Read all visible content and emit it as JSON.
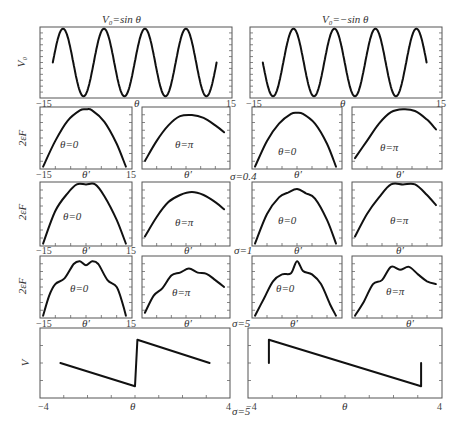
{
  "figure": {
    "row_titles": {
      "left": "V₀=sin θ",
      "right": "V₀=−sin θ"
    },
    "y_labels": {
      "row1": "V₀",
      "row2": "2εF",
      "row3": "2εF",
      "row4": "2εF",
      "row5": "V"
    },
    "x_labels": {
      "theta": "θ",
      "theta_prime": "θ′"
    },
    "ticks": {
      "neg15": "−15",
      "pos15": "15",
      "neg4": "−4",
      "pos4": "4"
    },
    "sigma_labels": {
      "s04": "σ=0.4",
      "s1": "σ=1",
      "s5a": "σ=5",
      "s5b": "σ=5"
    },
    "panel_labels": {
      "theta0": "θ=0",
      "thetapi": "θ=π"
    }
  },
  "chart_data": [
    {
      "type": "line",
      "title": "V₀=sin θ",
      "xlabel": "θ",
      "ylabel": "V₀",
      "xlim": [
        -15,
        15
      ],
      "x": [
        -13,
        -11.4,
        -9.8,
        -8.2,
        -6.6,
        -5,
        -3.4,
        -1.8,
        -0.2,
        1.4,
        3,
        4.6,
        6.2,
        7.8,
        9.4,
        11,
        12.6
      ],
      "values": [
        0,
        1,
        0,
        -1,
        0,
        1,
        0,
        -1,
        0,
        1,
        0,
        -1,
        0,
        1,
        0,
        -1,
        0
      ]
    },
    {
      "type": "line",
      "title": "V₀=−sin θ",
      "xlabel": "θ",
      "ylabel": "V₀",
      "xlim": [
        -15,
        15
      ],
      "x": [
        -13,
        -11.4,
        -9.8,
        -8.2,
        -6.6,
        -5,
        -3.4,
        -1.8,
        -0.2,
        1.4,
        3,
        4.6,
        6.2,
        7.8,
        9.4,
        11,
        12.6
      ],
      "values": [
        0,
        -1,
        0,
        1,
        0,
        -1,
        0,
        1,
        0,
        -1,
        0,
        1,
        0,
        -1,
        0,
        1,
        0
      ]
    },
    {
      "type": "line",
      "title": "σ=0.4, V₀=sin θ, θ=0",
      "xlabel": "θ′",
      "ylabel": "2εF",
      "xlim": [
        -15,
        15
      ],
      "x": [
        -14,
        -10,
        -6,
        -2,
        0,
        2,
        6,
        10,
        13
      ],
      "values": [
        0.0,
        0.45,
        0.8,
        0.98,
        1.0,
        0.98,
        0.78,
        0.4,
        0.0
      ]
    },
    {
      "type": "line",
      "title": "σ=0.4, V₀=sin θ, θ=π",
      "xlabel": "θ′",
      "ylabel": "2εF",
      "x": [
        -14,
        -10,
        -6,
        -2,
        2,
        6,
        10,
        13
      ],
      "values": [
        0.1,
        0.45,
        0.72,
        0.88,
        0.9,
        0.85,
        0.72,
        0.6
      ]
    },
    {
      "type": "line",
      "title": "σ=0.4, V₀=−sin θ, θ=0",
      "xlabel": "θ′",
      "ylabel": "2εF",
      "x": [
        -14,
        -10,
        -6,
        -2,
        0,
        2,
        6,
        10,
        13
      ],
      "values": [
        0.0,
        0.45,
        0.75,
        0.92,
        0.94,
        0.92,
        0.75,
        0.4,
        0.0
      ]
    },
    {
      "type": "line",
      "title": "σ=0.4, V₀=−sin θ, θ=π",
      "xlabel": "θ′",
      "ylabel": "2εF",
      "x": [
        -14,
        -10,
        -6,
        -2,
        2,
        6,
        10,
        13
      ],
      "values": [
        0.15,
        0.45,
        0.75,
        0.95,
        1.0,
        0.97,
        0.82,
        0.65
      ]
    },
    {
      "type": "line",
      "title": "σ=1, V₀=sin θ, θ=0",
      "xlabel": "θ′",
      "ylabel": "2εF",
      "xlim": [
        -15,
        15
      ],
      "x": [
        -14,
        -10,
        -6,
        -3,
        0,
        3,
        6,
        10,
        13
      ],
      "values": [
        0.0,
        0.55,
        0.85,
        1.0,
        1.0,
        1.0,
        0.8,
        0.4,
        0.0
      ]
    },
    {
      "type": "line",
      "title": "σ=1, V₀=sin θ, θ=π",
      "xlabel": "θ′",
      "ylabel": "2εF",
      "x": [
        -14,
        -10,
        -6,
        -2,
        2,
        6,
        10,
        13
      ],
      "values": [
        0.12,
        0.45,
        0.7,
        0.82,
        0.87,
        0.82,
        0.7,
        0.58
      ]
    },
    {
      "type": "line",
      "title": "σ=1, V₀=−sin θ, θ=0",
      "xlabel": "θ′",
      "ylabel": "2εF",
      "x": [
        -14,
        -10,
        -6,
        -3,
        0,
        3,
        6,
        10,
        13
      ],
      "values": [
        0.0,
        0.5,
        0.78,
        0.86,
        0.92,
        0.85,
        0.76,
        0.4,
        0.0
      ]
    },
    {
      "type": "line",
      "title": "σ=1, V₀=−sin θ, θ=π",
      "xlabel": "θ′",
      "ylabel": "2εF",
      "x": [
        -14,
        -10,
        -6,
        -2,
        2,
        6,
        10,
        13
      ],
      "values": [
        0.12,
        0.5,
        0.78,
        1.0,
        1.0,
        1.0,
        0.82,
        0.65
      ]
    },
    {
      "type": "line",
      "title": "σ=5, V₀=sin θ, θ=0",
      "xlabel": "θ′",
      "ylabel": "2εF",
      "xlim": [
        -15,
        15
      ],
      "x": [
        -14,
        -12,
        -10,
        -7,
        -4,
        -2,
        0,
        2,
        4,
        7,
        10,
        12,
        13
      ],
      "values": [
        0.0,
        0.35,
        0.55,
        0.65,
        0.9,
        0.95,
        0.88,
        0.95,
        0.9,
        0.62,
        0.5,
        0.2,
        0.0
      ]
    },
    {
      "type": "line",
      "title": "σ=5, V₀=sin θ, θ=π",
      "xlabel": "θ′",
      "ylabel": "2εF",
      "x": [
        -14,
        -11,
        -8,
        -5,
        -2,
        1,
        4,
        7,
        10,
        13
      ],
      "values": [
        0.05,
        0.35,
        0.48,
        0.7,
        0.75,
        0.82,
        0.75,
        0.73,
        0.62,
        0.5
      ]
    },
    {
      "type": "line",
      "title": "σ=5, V₀=−sin θ, θ=0",
      "xlabel": "θ′",
      "ylabel": "2εF",
      "x": [
        -14,
        -11,
        -8,
        -5,
        -2,
        0,
        2,
        5,
        8,
        11,
        13
      ],
      "values": [
        0.0,
        0.3,
        0.6,
        0.72,
        0.74,
        0.95,
        0.78,
        0.72,
        0.55,
        0.2,
        0.0
      ]
    },
    {
      "type": "line",
      "title": "σ=5, V₀=−sin θ, θ=π",
      "xlabel": "θ′",
      "ylabel": "2εF",
      "x": [
        -14,
        -11,
        -8,
        -5,
        -2,
        1,
        4,
        7,
        10,
        13
      ],
      "values": [
        0.0,
        0.25,
        0.55,
        0.62,
        0.85,
        0.8,
        0.85,
        0.72,
        0.6,
        0.55
      ]
    },
    {
      "type": "line",
      "title": "V, left",
      "xlabel": "θ",
      "ylabel": "V",
      "xlim": [
        -4,
        4
      ],
      "x": [
        -3.14,
        0.0,
        0.0,
        0.1,
        3.14
      ],
      "values": [
        0.0,
        -1.0,
        -1.0,
        1.0,
        0.0
      ]
    },
    {
      "type": "line",
      "title": "V, right",
      "xlabel": "θ",
      "ylabel": "V",
      "xlim": [
        -4,
        4
      ],
      "x": [
        -3.14,
        -3.14,
        3.14,
        3.14
      ],
      "values": [
        0.0,
        1.0,
        -1.0,
        0.0
      ]
    }
  ]
}
